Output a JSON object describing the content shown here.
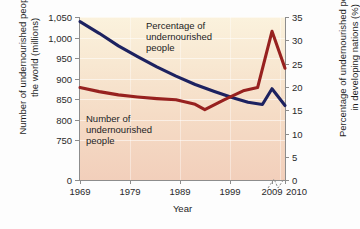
{
  "chart_data": {
    "type": "line",
    "title": "",
    "xlabel": "Year",
    "ylabel": "Number of undernourished people in the world (millions)",
    "ylabel_right": "Percentage of undernourished people in developing nations (%)",
    "xlim": [
      1969,
      2010
    ],
    "ylim": [
      700,
      1050
    ],
    "ylim_right": [
      0,
      35
    ],
    "grid": true,
    "legend_position": "in-plot annotations",
    "x_ticks": [
      "1969",
      "1979",
      "1989",
      "1999",
      "2009",
      "2010"
    ],
    "x_tick_values": [
      1969,
      1979,
      1989,
      1999,
      2009,
      2010
    ],
    "y_ticks_left": [
      "0",
      "750",
      "800",
      "850",
      "900",
      "950",
      "1,000",
      "1,050"
    ],
    "y_tick_values_left": [
      0,
      750,
      800,
      850,
      900,
      950,
      1000,
      1050
    ],
    "y_ticks_right": [
      "0",
      "5",
      "10",
      "15",
      "20",
      "25",
      "30",
      "35"
    ],
    "y_tick_values_right": [
      0,
      5,
      10,
      15,
      20,
      25,
      30,
      35
    ],
    "axis_break_between": [
      "2009",
      "2010"
    ],
    "series": [
      {
        "name": "Percentage of undernourished people",
        "axis": "right",
        "unit": "%",
        "color": "#1d2260",
        "x": [
          1969,
          1973,
          1977,
          1981,
          1985,
          1989,
          1993,
          1997,
          2001,
          2004,
          2007,
          2009,
          2010
        ],
        "values": [
          34.0,
          31.5,
          28.8,
          26.5,
          24.3,
          22.3,
          20.5,
          19.0,
          17.6,
          16.7,
          16.2,
          19.6,
          16.0
        ]
      },
      {
        "name": "Number of undernourished people",
        "axis": "left",
        "unit": "millions",
        "color": "#97211f",
        "x": [
          1969,
          1973,
          1977,
          1981,
          1985,
          1989,
          1993,
          1995,
          1999,
          2003,
          2006,
          2009,
          2010
        ],
        "values": [
          878,
          868,
          860,
          855,
          851,
          848,
          837,
          824,
          848,
          870,
          878,
          1015,
          925
        ]
      }
    ],
    "annotations": [
      {
        "id": "percentage-label",
        "text": "Percentage of\nundernourished\npeople",
        "series": "Percentage of undernourished people"
      },
      {
        "id": "number-label",
        "text": "Number of\nundernourished\npeople",
        "series": "Number of undernourished people"
      }
    ],
    "colors": {
      "blue_series": "#1d2260",
      "red_series": "#97211f",
      "plot_bg_top": "#fbf2dd",
      "plot_bg_bottom": "#f2cfbb",
      "axis": "#8d8d8d",
      "figure_bg": "#fdfdfd"
    }
  }
}
